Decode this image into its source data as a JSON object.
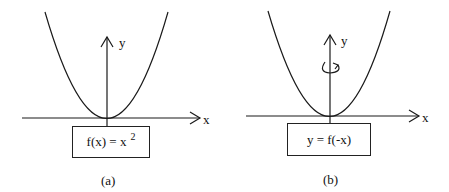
{
  "panels": [
    {
      "id": "a",
      "caption": "(a)",
      "axis_x_label": "x",
      "axis_y_label": "y",
      "formula_base": "f(x) = x",
      "formula_exponent": "2",
      "curve": "parabola y = x^2"
    },
    {
      "id": "b",
      "caption": "(b)",
      "axis_x_label": "x",
      "axis_y_label": "y",
      "formula_base": "y = f(-x)",
      "formula_exponent": "",
      "curve": "parabola reflected about y-axis",
      "annotation": "rotation-arrow around y-axis"
    }
  ],
  "colors": {
    "line": "#1a1a1a",
    "background": "#ffffff"
  }
}
